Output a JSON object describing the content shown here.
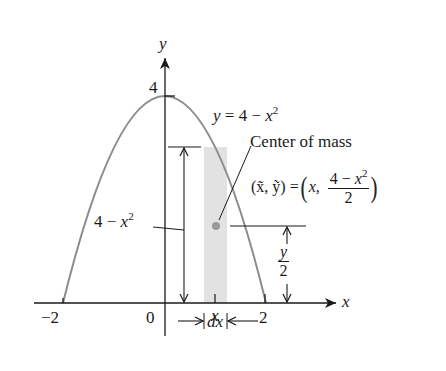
{
  "figure": {
    "colors": {
      "curve": "#8c8c8c",
      "strip": "#e2e2e2",
      "axes": "#1a1a1a",
      "centroid_dot": "#9a9a9a"
    },
    "axes": {
      "x_label": "x",
      "y_label": "y",
      "x_ticks": [
        {
          "label": "−2",
          "value": -2
        },
        {
          "label": "0",
          "value": 0
        },
        {
          "label": "x",
          "value": "x"
        },
        {
          "label": "2",
          "value": 2
        }
      ],
      "y_ticks": [
        {
          "label": "4",
          "value": 4
        }
      ]
    },
    "curve": {
      "equation_lhs": "y",
      "equation_eq": " = 4 − ",
      "equation_var": "x",
      "equation_exp": "2",
      "domain": [
        -2,
        2
      ]
    },
    "annotations": {
      "height_label_main": "4 − ",
      "height_label_var": "x",
      "height_label_exp": "2",
      "center_of_mass": "Center of mass",
      "centroid_lhs": "(x̃, ỹ) = ",
      "centroid_x": "x,",
      "centroid_num_main": "4 − ",
      "centroid_num_var": "x",
      "centroid_num_exp": "2",
      "centroid_den": "2",
      "half_height_num": "y",
      "half_height_den": "2",
      "strip_width_label": "dx"
    }
  }
}
